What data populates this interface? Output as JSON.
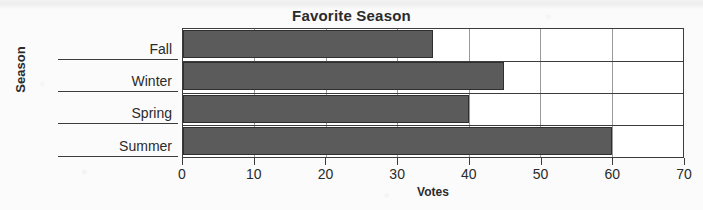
{
  "chart_data": {
    "type": "bar",
    "orientation": "horizontal",
    "title": "Favorite Season",
    "xlabel": "Votes",
    "ylabel": "Season",
    "categories": [
      "Fall",
      "Winter",
      "Spring",
      "Summer"
    ],
    "values": [
      35,
      45,
      40,
      60
    ],
    "xlim": [
      0,
      70
    ],
    "xticks": [
      0,
      10,
      20,
      30,
      40,
      50,
      60,
      70
    ],
    "xtick_labels": [
      "0",
      "10",
      "20",
      "30",
      "40",
      "50",
      "60",
      "70"
    ],
    "grid": "vertical",
    "legend": null,
    "series": [
      {
        "name": "Votes",
        "color": "#5b5b5b",
        "values": [
          35,
          45,
          40,
          60
        ]
      }
    ],
    "bars": [
      {
        "category": "Fall",
        "value": 35
      },
      {
        "category": "Winter",
        "value": 45
      },
      {
        "category": "Spring",
        "value": 40
      },
      {
        "category": "Summer",
        "value": 60
      }
    ]
  },
  "colors": {
    "bar_fill": "#5b5b5b",
    "bar_stroke": "#2f2f2f",
    "axis": "#3c3c3c",
    "grid": "#9a9a9a",
    "text": "#2b2b2b",
    "plot_background": "#ffffff",
    "page_background": "#fbfbfb"
  }
}
